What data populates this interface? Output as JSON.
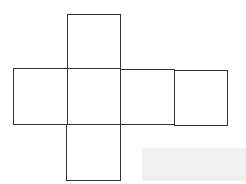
{
  "diagram": {
    "type": "cube-net",
    "stroke_color": "#333333",
    "background": "#ffffff",
    "faces": [
      {
        "id": "top",
        "x": 67,
        "y": 14,
        "w": 54,
        "h": 55
      },
      {
        "id": "left",
        "x": 13,
        "y": 68,
        "w": 55,
        "h": 57
      },
      {
        "id": "center",
        "x": 67,
        "y": 68,
        "w": 54,
        "h": 57
      },
      {
        "id": "right",
        "x": 120,
        "y": 69,
        "w": 55,
        "h": 56
      },
      {
        "id": "far-right",
        "x": 174,
        "y": 70,
        "w": 54,
        "h": 56
      },
      {
        "id": "bottom",
        "x": 66,
        "y": 124,
        "w": 55,
        "h": 57
      }
    ],
    "shaded_region": {
      "x": 142,
      "y": 148,
      "w": 104,
      "h": 33,
      "color": "#f0f0f0"
    }
  }
}
